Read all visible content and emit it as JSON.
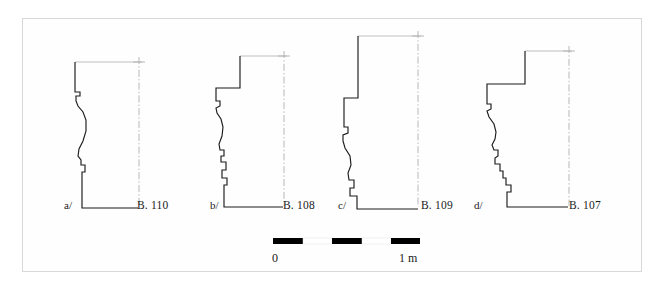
{
  "figure": {
    "kind": "archaeological-molding-profile-plate",
    "background_color": "#ffffff",
    "frame_color": "#d8d8d8",
    "ink_color": "#1b1b1b",
    "guide_color": "#b0b0b0"
  },
  "profiles": [
    {
      "key": "a/",
      "catalog": "B. 110",
      "key_x": 64,
      "key_y": 209,
      "catalog_x": 137,
      "catalog_y": 209,
      "top_rule": "M 75 62 L 142 62",
      "centerline": "M 139 57 L 139 206",
      "centerline_tick": "M 133 62 L 145 62",
      "outline": "M 75 62 L 75 92 L 80 92 L 80 96 L 76 96 L 76 101 L 78 106 L 83 112 L 86 120 L 86 131 L 83 141 L 79 149 L 78 156 L 81 160 L 81 165 L 85 165 L 85 172 L 82 172 L 82 208 L 138 208"
    },
    {
      "key": "b/",
      "catalog": "B. 108",
      "key_x": 210,
      "key_y": 209,
      "catalog_x": 283,
      "catalog_y": 209,
      "top_rule": "M 240 56 L 287 56",
      "centerline": "M 284 51 L 284 206",
      "centerline_tick": "M 278 56 L 290 56",
      "outline": "M 240 56 L 240 88 L 216 88 L 216 101 L 220 101 L 220 106 L 216 108 L 217 113 L 221 119 L 223 127 L 222 136 L 219 144 L 220 150 L 224 150 L 224 156 L 221 156 L 221 162 L 226 162 L 226 170 L 222 170 L 222 178 L 227 178 L 227 185 L 224 185 L 224 207 L 283 207"
    },
    {
      "key": "c/",
      "catalog": "B. 109",
      "key_x": 338,
      "key_y": 209,
      "catalog_x": 421,
      "catalog_y": 209,
      "top_rule": "M 358 36 L 421 36",
      "centerline": "M 418 31 L 418 207",
      "centerline_tick": "M 412 36 L 424 36",
      "outline": "M 358 36 L 358 98 L 344 98 L 344 127 L 348 127 L 348 133 L 343 135 L 343 141 L 345 148 L 350 156 L 351 165 L 348 173 L 349 180 L 354 180 L 354 188 L 350 188 L 350 196 L 357 196 L 357 209 L 418 209"
    },
    {
      "key": "d/",
      "catalog": "B. 107",
      "key_x": 474,
      "key_y": 209,
      "catalog_x": 569,
      "catalog_y": 209,
      "top_rule": "M 525 51 L 572 51",
      "centerline": "M 569 46 L 569 206",
      "centerline_tick": "M 563 51 L 575 51",
      "outline": "M 525 51 L 525 84 L 487 84 L 487 104 L 491 104 L 491 109 L 487 111 L 489 117 L 494 124 L 496 132 L 495 139 L 492 145 L 494 150 L 498 150 L 498 156 L 495 158 L 495 164 L 500 164 L 500 171 L 503 171 L 503 178 L 506 178 L 506 185 L 511 185 L 511 192 L 507 192 L 507 207 L 568 207"
    }
  ],
  "scalebar": {
    "x_start": 273,
    "x_end": 420,
    "y": 238,
    "height": 6,
    "segments": [
      {
        "fill": "dark",
        "x": 273,
        "width": 30
      },
      {
        "fill": "light",
        "x": 303,
        "width": 29
      },
      {
        "fill": "dark",
        "x": 332,
        "width": 30
      },
      {
        "fill": "light",
        "x": 362,
        "width": 29
      },
      {
        "fill": "dark",
        "x": 391,
        "width": 29
      }
    ],
    "label_left": "0",
    "label_left_x": 272,
    "label_right": "1 m",
    "label_right_x": 399,
    "label_y": 262,
    "unit": "m",
    "total_length_value": 1
  }
}
